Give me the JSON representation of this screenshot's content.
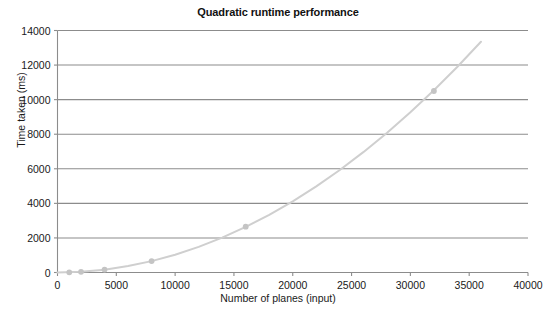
{
  "chart_data": {
    "type": "line",
    "title": "Quadratic runtime performance",
    "xlabel": "Number of planes (input)",
    "ylabel": "Time taken (ms)",
    "xlim": [
      0,
      40000
    ],
    "ylim": [
      0,
      14000
    ],
    "xticks": [
      0,
      5000,
      10000,
      15000,
      20000,
      25000,
      30000,
      35000,
      40000
    ],
    "yticks": [
      0,
      2000,
      4000,
      6000,
      8000,
      10000,
      12000,
      14000
    ],
    "xtick_labels": [
      "0",
      "5000",
      "10000",
      "15000",
      "20000",
      "25000",
      "30000",
      "35000",
      "40000"
    ],
    "ytick_labels": [
      "0",
      "2000",
      "4000",
      "6000",
      "8000",
      "10000",
      "12000",
      "14000"
    ],
    "grid": "horizontal",
    "legend": "none",
    "series": [
      {
        "name": "Quadratic runtime",
        "line_color": "#cfcfcf",
        "marker_color": "#c4c4c4",
        "marker": "circle",
        "x": [
          1000,
          2000,
          4000,
          8000,
          16000,
          32000
        ],
        "values": [
          10,
          40,
          170,
          660,
          2650,
          10500
        ],
        "curve_x": [
          0,
          2000,
          4000,
          6000,
          8000,
          10000,
          12000,
          14000,
          16000,
          18000,
          20000,
          22000,
          24000,
          26000,
          28000,
          30000,
          32000,
          34000,
          36000
        ],
        "curve_y": [
          0,
          41,
          165,
          371,
          659,
          1030,
          1483,
          2018,
          2636,
          3336,
          4119,
          4984,
          5932,
          6962,
          8074,
          9269,
          10546,
          11906,
          13348
        ]
      }
    ]
  },
  "colors": {
    "background": "#ffffff",
    "grid": "#8c8c8c",
    "axis": "#8c8c8c",
    "curve": "#cfcfcf",
    "marker": "#c4c4c4",
    "text": "#1a1a1a"
  }
}
